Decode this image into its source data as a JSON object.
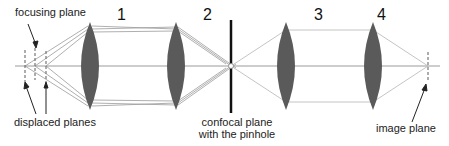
{
  "diagram": {
    "lens_numbers": [
      "1",
      "2",
      "3",
      "4"
    ],
    "labels": {
      "focusing_plane": "focusing plane",
      "displaced_planes": "displaced planes",
      "confocal_line1": "confocal plane",
      "confocal_line2": "with the pinhole",
      "image_plane": "image plane"
    },
    "colors": {
      "lens": "#5a5a5a",
      "ray": "#9a9a9a",
      "pinhole": "#111111",
      "text": "#222222"
    }
  }
}
